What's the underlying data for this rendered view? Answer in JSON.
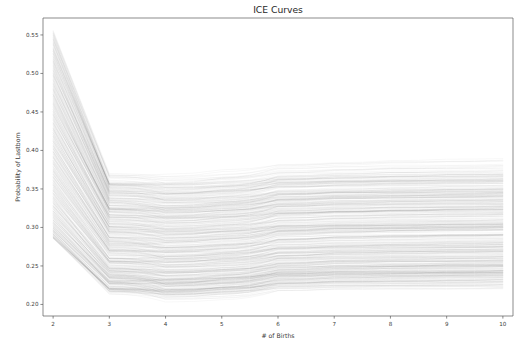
{
  "chart_data": {
    "type": "line",
    "title": "ICE Curves",
    "xlabel": "# of Births",
    "ylabel": "Probability of Lastborn",
    "xlim": [
      1.82,
      10.18
    ],
    "ylim": [
      0.185,
      0.572
    ],
    "grid": false,
    "legend": null,
    "x": [
      2,
      3,
      4,
      5,
      6,
      7,
      8,
      9,
      10
    ],
    "xticks": [
      2,
      3,
      4,
      5,
      6,
      7,
      8,
      9,
      10
    ],
    "xticklabels": [
      "2",
      "3",
      "4",
      "5",
      "6",
      "7",
      "8",
      "9",
      "10"
    ],
    "yticks": [
      0.2,
      0.25,
      0.3,
      0.35,
      0.4,
      0.45,
      0.5,
      0.55
    ],
    "yticklabels": [
      "0.20",
      "0.25",
      "0.30",
      "0.35",
      "0.40",
      "0.45",
      "0.50",
      "0.55"
    ],
    "series_count": 420,
    "line_color": "#1a1a1a",
    "line_alpha": 0.07,
    "line_width": 0.45,
    "band_envelope": {
      "x": [
        2,
        3,
        4,
        5,
        6,
        7,
        8,
        9,
        10
      ],
      "max": [
        0.556,
        0.376,
        0.352,
        0.345,
        0.344,
        0.345,
        0.346,
        0.347,
        0.348
      ],
      "q75": [
        0.492,
        0.33,
        0.316,
        0.312,
        0.313,
        0.316,
        0.319,
        0.321,
        0.323
      ],
      "median": [
        0.437,
        0.302,
        0.289,
        0.286,
        0.288,
        0.291,
        0.294,
        0.296,
        0.298
      ],
      "q25": [
        0.382,
        0.276,
        0.263,
        0.26,
        0.262,
        0.265,
        0.268,
        0.27,
        0.272
      ],
      "min": [
        0.286,
        0.214,
        0.206,
        0.205,
        0.208,
        0.212,
        0.216,
        0.22,
        0.224
      ]
    },
    "dense_band": {
      "label": "highest line density at right side",
      "y_low": 0.278,
      "y_high": 0.332
    },
    "curve_model": {
      "start_min": 0.286,
      "start_max": 0.556,
      "drop_ratio_min": 0.655,
      "drop_ratio_max": 0.76,
      "dip_depth_min": 0.004,
      "dip_depth_max": 0.02,
      "tail_rise_min": 0.002,
      "tail_rise_max": 0.026,
      "jitter": 0.0016
    }
  },
  "figure": {
    "background": "#ffffff",
    "axes_color": "#5a5a5a",
    "text_color": "#262626"
  },
  "geometry": {
    "plot_left": 43,
    "plot_right": 513,
    "plot_top": 18,
    "plot_bottom": 316,
    "title_y": 13,
    "xlabel_y": 338,
    "ylabel_x": 20
  }
}
